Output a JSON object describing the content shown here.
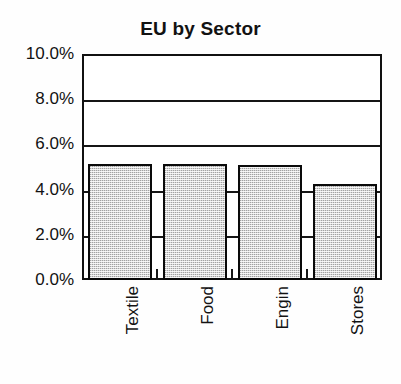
{
  "chart_data": {
    "type": "bar",
    "title": "EU by Sector",
    "xlabel": "",
    "ylabel": "",
    "categories": [
      "Textile",
      "Food",
      "Engin",
      "Stores"
    ],
    "values": [
      5.15,
      5.15,
      5.1,
      4.25
    ],
    "value_format": "percent",
    "ylim": [
      0.0,
      10.0
    ],
    "y_ticks": [
      0.0,
      2.0,
      4.0,
      6.0,
      8.0,
      10.0
    ],
    "y_tick_labels": [
      "0.0%",
      "2.0%",
      "4.0%",
      "6.0%",
      "8.0%",
      "10.0%"
    ],
    "grid": true,
    "grid_axis": "y",
    "legend": false,
    "legend_position": "none",
    "bar_fill_color": "#d7d7d7",
    "bar_edge_color": "#0a0a0a",
    "axis_color": "#111111",
    "background_color": "#ffffff",
    "bar_fill_style": "dither-gray"
  },
  "axis": {
    "y_labels": [
      {
        "text": "10.0%",
        "value": 10.0
      },
      {
        "text": "8.0%",
        "value": 8.0
      },
      {
        "text": "6.0%",
        "value": 6.0
      },
      {
        "text": "4.0%",
        "value": 4.0
      },
      {
        "text": "2.0%",
        "value": 2.0
      },
      {
        "text": "0.0%",
        "value": 0.0
      }
    ]
  }
}
